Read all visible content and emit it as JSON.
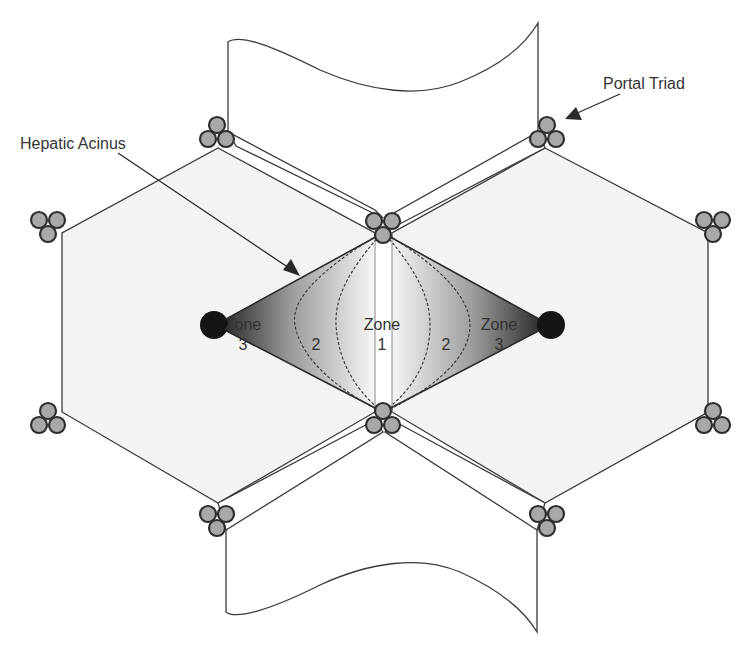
{
  "labels": {
    "hepatic_acinus": "Hepatic Acinus",
    "portal_triad": "Portal Triad"
  },
  "zones": {
    "left_zone3_word": "Zone",
    "left_zone3_num": "3",
    "left_zone2_num": "2",
    "center_zone1_word": "Zone",
    "center_zone1_num": "1",
    "right_zone2_num": "2",
    "right_zone3_word": "Zone",
    "right_zone3_num": "3"
  },
  "colors": {
    "background": "#ffffff",
    "lobule_fill": "#f3f3f3",
    "line": "#3a3a3a",
    "triad_fill": "#a8a8a8",
    "triad_stroke": "#2e2e2e",
    "central_vein": "#151515"
  }
}
